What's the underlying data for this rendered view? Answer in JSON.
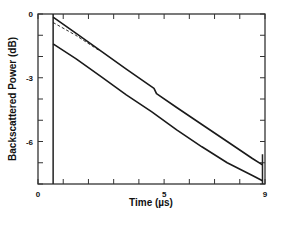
{
  "chart_data": {
    "type": "line",
    "title": "",
    "xlabel": "Time  (µs)",
    "ylabel": "Backscattered  Power  (dB)",
    "xlim": [
      0,
      9
    ],
    "ylim": [
      -8,
      0
    ],
    "x_tick_labels": [
      "0",
      "5",
      "9"
    ],
    "x_tick_values": [
      0,
      5,
      9
    ],
    "y_tick_labels": [
      "0",
      "-3",
      "-6"
    ],
    "y_tick_values": [
      0,
      -3,
      -6
    ],
    "grid": false,
    "legend": null,
    "annotations": [
      {
        "type": "vertical-line",
        "x": 0.6,
        "description": "pulse launch marker"
      },
      {
        "type": "vertical-line",
        "x": 8.9,
        "description": "fiber end marker"
      }
    ],
    "series": [
      {
        "name": "upper trace",
        "style": "solid",
        "x": [
          0.6,
          1.5,
          2.5,
          3.5,
          4.6,
          4.7,
          5.5,
          6.5,
          7.5,
          8.5,
          8.9
        ],
        "y": [
          -0.15,
          -0.9,
          -1.75,
          -2.6,
          -3.5,
          -3.75,
          -4.4,
          -5.2,
          -6.0,
          -6.8,
          -7.1
        ]
      },
      {
        "name": "upper trace (fit)",
        "style": "dashed",
        "x": [
          0.6,
          1.5,
          2.4
        ],
        "y": [
          -0.4,
          -1.0,
          -1.7
        ]
      },
      {
        "name": "lower trace",
        "style": "solid",
        "x": [
          0.6,
          1.5,
          2.5,
          3.5,
          4.5,
          5.5,
          6.5,
          7.5,
          8.5,
          8.9
        ],
        "y": [
          -1.4,
          -2.1,
          -2.95,
          -3.8,
          -4.6,
          -5.45,
          -6.25,
          -7.0,
          -7.6,
          -7.85
        ]
      }
    ]
  }
}
